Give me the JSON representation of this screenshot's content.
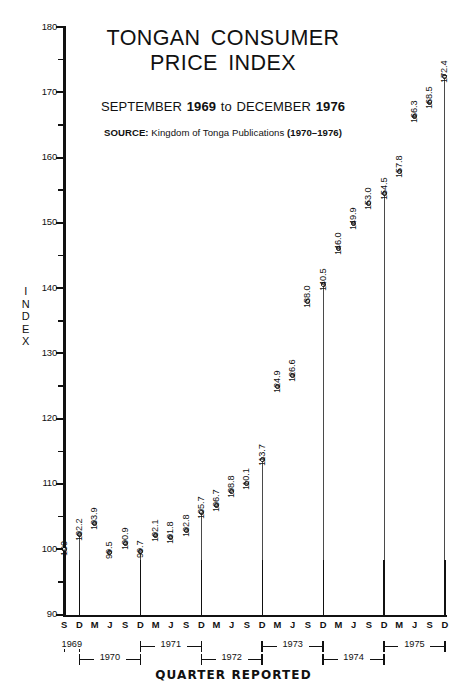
{
  "chart_data": {
    "type": "scatter",
    "title": "TONGAN CONSUMER PRICE INDEX",
    "subtitle_prefix": "SEPTEMBER ",
    "subtitle_year1": "1969",
    "subtitle_mid": " to DECEMBER ",
    "subtitle_year2": "1976",
    "source_label": "SOURCE:",
    "source_text": " Kingdom of Tonga Publications ",
    "source_years": "(1970–1976)",
    "xlabel": "QUARTER REPORTED",
    "ylabel": "INDEX",
    "ylim": [
      90,
      180
    ],
    "ytick_major": [
      90,
      100,
      110,
      120,
      130,
      140,
      150,
      160,
      170,
      180
    ],
    "ytick_minor": [
      95,
      105,
      115,
      125,
      135,
      145,
      155,
      165,
      175
    ],
    "grid": false,
    "legend": "none",
    "quarter_labels": [
      "S",
      "D",
      "M",
      "J",
      "S",
      "D",
      "M",
      "J",
      "S",
      "D",
      "M",
      "J",
      "S",
      "D",
      "M",
      "J",
      "S",
      "D",
      "M",
      "J",
      "S",
      "D",
      "M",
      "J",
      "S",
      "D"
    ],
    "x": [
      "1969-S",
      "1969-D",
      "1970-M",
      "1970-J",
      "1970-S",
      "1970-D",
      "1971-M",
      "1971-J",
      "1971-S",
      "1971-D",
      "1972-M",
      "1972-J",
      "1972-S",
      "1972-D",
      "1973-M",
      "1973-J",
      "1973-S",
      "1973-D",
      "1974-M",
      "1974-J",
      "1974-S",
      "1974-D",
      "1975-M",
      "1975-J",
      "1975-S",
      "1975-D"
    ],
    "values": [
      100,
      102.2,
      103.9,
      99.5,
      100.9,
      99.7,
      102.1,
      101.8,
      102.8,
      105.7,
      106.7,
      108.8,
      110.1,
      113.7,
      124.9,
      126.6,
      138.0,
      140.5,
      146.0,
      149.9,
      153.0,
      154.5,
      157.8,
      166.3,
      168.5,
      172.4
    ],
    "value_labels": [
      "100",
      "102.2",
      "103.9",
      "99.5",
      "100.9",
      "99.7",
      "102.1",
      "101.8",
      "102.8",
      "105.7",
      "106.7",
      "108.8",
      "110.1",
      "113.7",
      "124.9",
      "126.6",
      "138.0",
      "140.5",
      "146.0",
      "149.9",
      "153.0",
      "154.5",
      "157.8",
      "166.3",
      "168.5",
      "172.4"
    ],
    "dropline_indices": [
      1,
      5,
      9,
      13,
      17,
      21,
      25
    ],
    "years": [
      {
        "label": "1969",
        "row": "top",
        "start": 0,
        "end": 1
      },
      {
        "label": "1970",
        "row": "bottom",
        "start": 1,
        "end": 5
      },
      {
        "label": "1971",
        "row": "top",
        "start": 5,
        "end": 9
      },
      {
        "label": "1972",
        "row": "bottom",
        "start": 9,
        "end": 13
      },
      {
        "label": "1973",
        "row": "top",
        "start": 13,
        "end": 17
      },
      {
        "label": "1974",
        "row": "bottom",
        "start": 17,
        "end": 21
      },
      {
        "label": "1975",
        "row": "top",
        "start": 21,
        "end": 25
      }
    ]
  }
}
